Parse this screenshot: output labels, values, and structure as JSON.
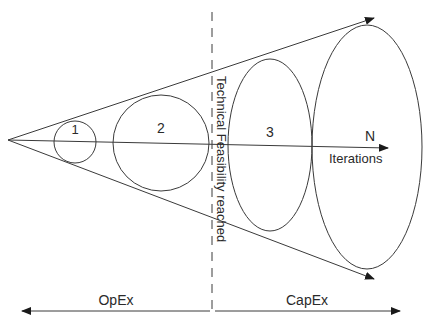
{
  "diagram": {
    "stroke_color": "#3a3a3a",
    "iterations": [
      {
        "label": "1"
      },
      {
        "label": "2"
      },
      {
        "label": "3"
      },
      {
        "label": "N"
      }
    ],
    "axis_label": "Iterations",
    "milestone_label": "Technical Feasibility reached",
    "phases": {
      "left": "OpEx",
      "right": "CapEx"
    }
  }
}
